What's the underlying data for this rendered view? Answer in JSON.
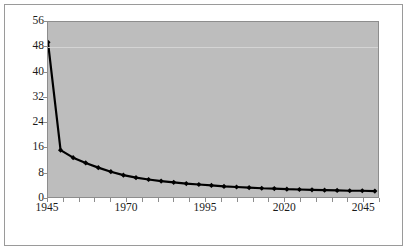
{
  "chart_data": {
    "type": "line",
    "title": "",
    "subtitle": "",
    "xlabel": "",
    "ylabel": "",
    "legend": [],
    "legend_position": "none",
    "grid": true,
    "grid_axis": "y",
    "plot_background": "#bdbdbd",
    "line_color": "#000000",
    "marker": "diamond",
    "marker_color": "#000000",
    "xlim": [
      1945,
      2050
    ],
    "ylim": [
      0,
      56
    ],
    "y_tick_step": 8,
    "x_tick_step": 5,
    "x_label_step": 25,
    "y_ticks": [
      0,
      8,
      16,
      24,
      32,
      40,
      48,
      56
    ],
    "y_tick_labels": [
      "0",
      "8",
      "16",
      "24",
      "32",
      "40",
      "48",
      "56"
    ],
    "x_ticks": [
      1945,
      1950,
      1955,
      1960,
      1965,
      1970,
      1975,
      1980,
      1985,
      1990,
      1995,
      2000,
      2005,
      2010,
      2015,
      2020,
      2025,
      2030,
      2035,
      2040,
      2045,
      2050
    ],
    "x_tick_labels": [
      "1945",
      "1970",
      "1995",
      "2020",
      "2045"
    ],
    "x_labeled_ticks": [
      1945,
      1970,
      1995,
      2020,
      2045
    ],
    "x": [
      1945,
      1949,
      1953,
      1957,
      1961,
      1965,
      1969,
      1973,
      1977,
      1981,
      1985,
      1989,
      1993,
      1997,
      2001,
      2005,
      2009,
      2013,
      2017,
      2021,
      2025,
      2029,
      2033,
      2037,
      2041,
      2045,
      2049
    ],
    "values": [
      49.5,
      15.0,
      12.6,
      10.9,
      9.4,
      8.1,
      7.0,
      6.2,
      5.6,
      5.1,
      4.7,
      4.3,
      4.0,
      3.7,
      3.4,
      3.2,
      3.0,
      2.8,
      2.7,
      2.5,
      2.4,
      2.3,
      2.2,
      2.1,
      2.0,
      2.0,
      1.9
    ],
    "series": [
      {
        "name": "series-1",
        "values": [
          49.5,
          15.0,
          12.6,
          10.9,
          9.4,
          8.1,
          7.0,
          6.2,
          5.6,
          5.1,
          4.7,
          4.3,
          4.0,
          3.7,
          3.4,
          3.2,
          3.0,
          2.8,
          2.7,
          2.5,
          2.4,
          2.3,
          2.2,
          2.1,
          2.0,
          2.0,
          1.9
        ]
      }
    ]
  },
  "colors": {
    "plot_background": "#bdbdbd",
    "frame_border": "#9a9a9a",
    "axis": "#8d8d8d",
    "gridline": "#d8d8d8",
    "line": "#000000",
    "text": "#1a1a1a"
  }
}
